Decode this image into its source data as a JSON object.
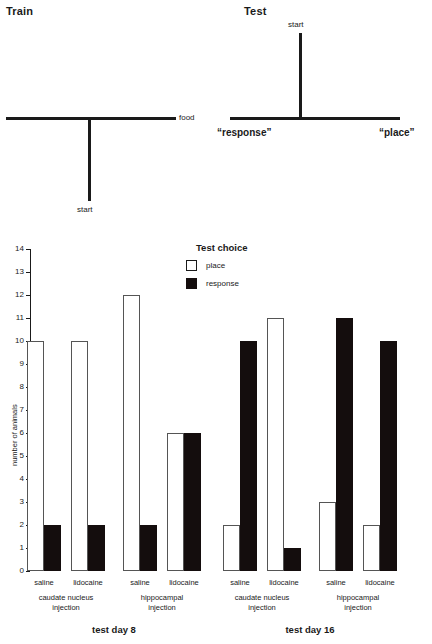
{
  "mazes": [
    {
      "title": "Train",
      "type": "T-maze-upright",
      "labels": {
        "arm_right": "food",
        "stem_bottom": "start"
      }
    },
    {
      "title": "Test",
      "type": "T-maze-inverted",
      "labels": {
        "stem_top": "start",
        "arm_left": "“response”",
        "arm_right": "“place”"
      }
    }
  ],
  "legend": {
    "title": "Test choice",
    "items": [
      {
        "label": "place",
        "color": "#ffffff",
        "key": "place"
      },
      {
        "label": "response",
        "color": "#140d0d",
        "key": "response"
      }
    ]
  },
  "chart_data": {
    "type": "bar",
    "title": "",
    "xlabel": "",
    "ylabel": "number of animals",
    "ylim": [
      0,
      14
    ],
    "ytick_labels": [
      "0",
      "1",
      "2",
      "3",
      "4",
      "5",
      "6",
      "7",
      "8",
      "9",
      "10",
      "11",
      "12",
      "13",
      "14"
    ],
    "grid": false,
    "legend_position": "top-center",
    "categories": [
      "saline",
      "lidocaine",
      "saline",
      "lidocaine",
      "saline",
      "lidocaine",
      "saline",
      "lidocaine"
    ],
    "series": [
      {
        "name": "place",
        "values": [
          10,
          10,
          12,
          6,
          2,
          11,
          3,
          2
        ]
      },
      {
        "name": "response",
        "values": [
          2,
          2,
          2,
          6,
          10,
          1,
          11,
          10
        ]
      }
    ],
    "groups": [
      {
        "label": "caudate nucleus injection",
        "line1": "caudate nucleus",
        "line2": "injection",
        "day": "test day 8",
        "categories": [
          "saline",
          "lidocaine"
        ]
      },
      {
        "label": "hippocampal injection",
        "line1": "hippocampal",
        "line2": "injection",
        "day": "test day 8",
        "categories": [
          "saline",
          "lidocaine"
        ]
      },
      {
        "label": "caudate nucleus injection",
        "line1": "caudate nucleus",
        "line2": "injection",
        "day": "test day 16",
        "categories": [
          "saline",
          "lidocaine"
        ]
      },
      {
        "label": "hippocampal injection",
        "line1": "hippocampal",
        "line2": "injection",
        "day": "test day 16",
        "categories": [
          "saline",
          "lidocaine"
        ]
      }
    ],
    "days": [
      "test day 8",
      "test day 16"
    ]
  }
}
